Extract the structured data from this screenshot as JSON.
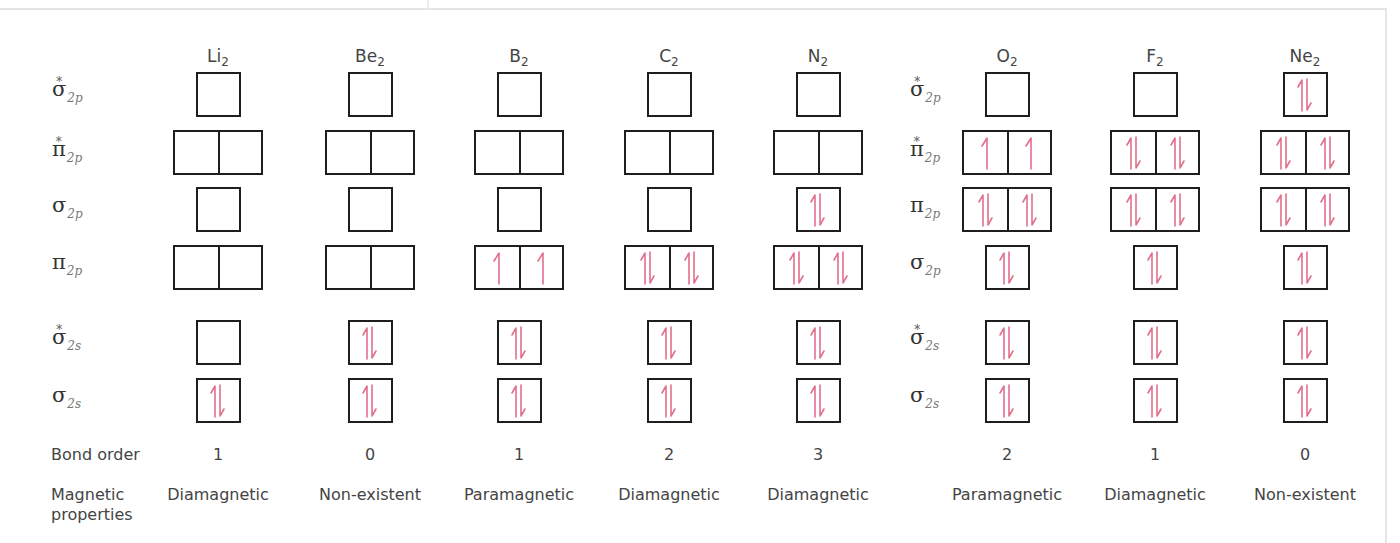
{
  "colors": {
    "box_border": "#1e1e1e",
    "electron": "#e0708c",
    "text": "#444444"
  },
  "row_labels": {
    "left": [
      {
        "key": "sigma2p_star",
        "symbol": "σ",
        "sub": "2p",
        "star": true,
        "top": 78
      },
      {
        "key": "pi2p_star",
        "symbol": "π",
        "sub": "2p",
        "star": true,
        "top": 138
      },
      {
        "key": "sigma2p",
        "symbol": "σ",
        "sub": "2p",
        "star": false,
        "top": 195
      },
      {
        "key": "pi2p",
        "symbol": "π",
        "sub": "2p",
        "star": false,
        "top": 252
      },
      {
        "key": "sigma2s_star",
        "symbol": "σ",
        "sub": "2s",
        "star": true,
        "top": 326
      },
      {
        "key": "sigma2s",
        "symbol": "σ",
        "sub": "2s",
        "star": false,
        "top": 385
      }
    ],
    "right": [
      {
        "key": "sigma2p_star",
        "symbol": "σ",
        "sub": "2p",
        "star": true,
        "top": 78
      },
      {
        "key": "pi2p_star",
        "symbol": "π",
        "sub": "2p",
        "star": true,
        "top": 138
      },
      {
        "key": "pi2p",
        "symbol": "π",
        "sub": "2p",
        "star": false,
        "top": 195
      },
      {
        "key": "sigma2p",
        "symbol": "σ",
        "sub": "2p",
        "star": false,
        "top": 252
      },
      {
        "key": "sigma2s_star",
        "symbol": "σ",
        "sub": "2s",
        "star": true,
        "top": 326
      },
      {
        "key": "sigma2s",
        "symbol": "σ",
        "sub": "2s",
        "star": false,
        "top": 385
      }
    ]
  },
  "footer_labels": {
    "bond_order": "Bond order",
    "magnetic_line1": "Magnetic",
    "magnetic_line2": "properties"
  },
  "row_tops": [
    72,
    130,
    187,
    245,
    320,
    378
  ],
  "molecules": [
    {
      "name": "Li",
      "sub": "2",
      "cx": 218,
      "bond_order": "1",
      "magnetic": "Diamagnetic",
      "orbitals": [
        {
          "type": "single",
          "e": [
            0
          ]
        },
        {
          "type": "pair",
          "e": [
            0,
            0
          ]
        },
        {
          "type": "single",
          "e": [
            0
          ]
        },
        {
          "type": "pair",
          "e": [
            0,
            0
          ]
        },
        {
          "type": "single",
          "e": [
            0
          ]
        },
        {
          "type": "single",
          "e": [
            2
          ]
        }
      ]
    },
    {
      "name": "Be",
      "sub": "2",
      "cx": 370,
      "bond_order": "0",
      "magnetic": "Non-existent",
      "orbitals": [
        {
          "type": "single",
          "e": [
            0
          ]
        },
        {
          "type": "pair",
          "e": [
            0,
            0
          ]
        },
        {
          "type": "single",
          "e": [
            0
          ]
        },
        {
          "type": "pair",
          "e": [
            0,
            0
          ]
        },
        {
          "type": "single",
          "e": [
            2
          ]
        },
        {
          "type": "single",
          "e": [
            2
          ]
        }
      ]
    },
    {
      "name": "B",
      "sub": "2",
      "cx": 519,
      "bond_order": "1",
      "magnetic": "Paramagnetic",
      "orbitals": [
        {
          "type": "single",
          "e": [
            0
          ]
        },
        {
          "type": "pair",
          "e": [
            0,
            0
          ]
        },
        {
          "type": "single",
          "e": [
            0
          ]
        },
        {
          "type": "pair",
          "e": [
            1,
            1
          ]
        },
        {
          "type": "single",
          "e": [
            2
          ]
        },
        {
          "type": "single",
          "e": [
            2
          ]
        }
      ]
    },
    {
      "name": "C",
      "sub": "2",
      "cx": 669,
      "bond_order": "2",
      "magnetic": "Diamagnetic",
      "orbitals": [
        {
          "type": "single",
          "e": [
            0
          ]
        },
        {
          "type": "pair",
          "e": [
            0,
            0
          ]
        },
        {
          "type": "single",
          "e": [
            0
          ]
        },
        {
          "type": "pair",
          "e": [
            2,
            2
          ]
        },
        {
          "type": "single",
          "e": [
            2
          ]
        },
        {
          "type": "single",
          "e": [
            2
          ]
        }
      ]
    },
    {
      "name": "N",
      "sub": "2",
      "cx": 818,
      "bond_order": "3",
      "magnetic": "Diamagnetic",
      "orbitals": [
        {
          "type": "single",
          "e": [
            0
          ]
        },
        {
          "type": "pair",
          "e": [
            0,
            0
          ]
        },
        {
          "type": "single",
          "e": [
            2
          ]
        },
        {
          "type": "pair",
          "e": [
            2,
            2
          ]
        },
        {
          "type": "single",
          "e": [
            2
          ]
        },
        {
          "type": "single",
          "e": [
            2
          ]
        }
      ]
    },
    {
      "name": "O",
      "sub": "2",
      "cx": 1007,
      "bond_order": "2",
      "magnetic": "Paramagnetic",
      "orbitals": [
        {
          "type": "single",
          "e": [
            0
          ]
        },
        {
          "type": "pair",
          "e": [
            1,
            1
          ]
        },
        {
          "type": "pair",
          "e": [
            2,
            2
          ]
        },
        {
          "type": "single",
          "e": [
            2
          ]
        },
        {
          "type": "single",
          "e": [
            2
          ]
        },
        {
          "type": "single",
          "e": [
            2
          ]
        }
      ]
    },
    {
      "name": "F",
      "sub": "2",
      "cx": 1155,
      "bond_order": "1",
      "magnetic": "Diamagnetic",
      "orbitals": [
        {
          "type": "single",
          "e": [
            0
          ]
        },
        {
          "type": "pair",
          "e": [
            2,
            2
          ]
        },
        {
          "type": "pair",
          "e": [
            2,
            2
          ]
        },
        {
          "type": "single",
          "e": [
            2
          ]
        },
        {
          "type": "single",
          "e": [
            2
          ]
        },
        {
          "type": "single",
          "e": [
            2
          ]
        }
      ]
    },
    {
      "name": "Ne",
      "sub": "2",
      "cx": 1305,
      "bond_order": "0",
      "magnetic": "Non-existent",
      "orbitals": [
        {
          "type": "single",
          "e": [
            2
          ]
        },
        {
          "type": "pair",
          "e": [
            2,
            2
          ]
        },
        {
          "type": "pair",
          "e": [
            2,
            2
          ]
        },
        {
          "type": "single",
          "e": [
            2
          ]
        },
        {
          "type": "single",
          "e": [
            2
          ]
        },
        {
          "type": "single",
          "e": [
            2
          ]
        }
      ]
    }
  ]
}
